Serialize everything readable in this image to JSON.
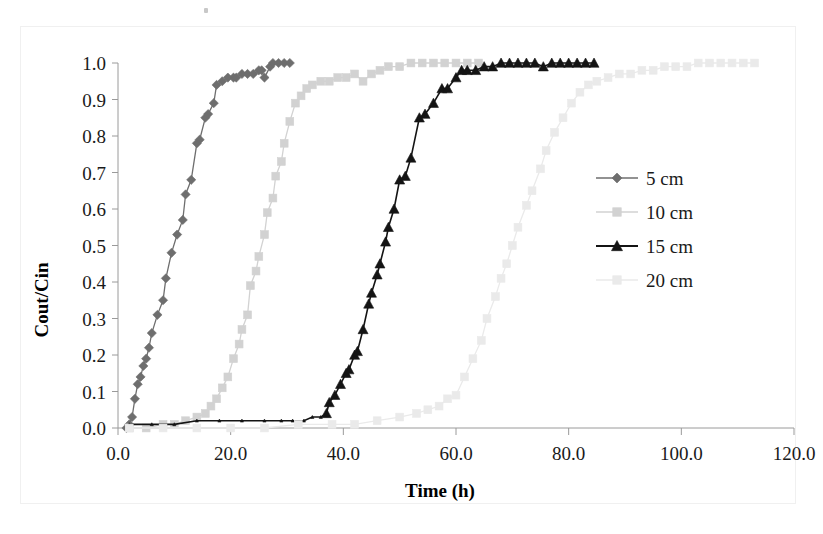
{
  "chart_data": {
    "type": "line",
    "title": "",
    "xlabel": "Time (h)",
    "ylabel": "Cout/Cin",
    "xlim": [
      0,
      120
    ],
    "ylim": [
      0,
      1.0
    ],
    "grid": false,
    "legend_position": "right",
    "x_ticks": [
      "0.0",
      "20.0",
      "40.0",
      "60.0",
      "80.0",
      "100.0",
      "120.0"
    ],
    "x_tick_values": [
      0,
      20,
      40,
      60,
      80,
      100,
      120
    ],
    "y_ticks": [
      "0.0",
      "0.1",
      "0.2",
      "0.3",
      "0.4",
      "0.5",
      "0.6",
      "0.7",
      "0.8",
      "0.9",
      "1.0"
    ],
    "y_tick_values": [
      0,
      0.1,
      0.2,
      0.3,
      0.4,
      0.5,
      0.6,
      0.7,
      0.8,
      0.9,
      1.0
    ],
    "series": [
      {
        "name": "5 cm",
        "color": "#6e6e6e",
        "marker": "diamond",
        "points": [
          [
            1.5,
            0.0
          ],
          [
            2.0,
            0.01
          ],
          [
            2.5,
            0.03
          ],
          [
            3.0,
            0.08
          ],
          [
            3.5,
            0.12
          ],
          [
            4.0,
            0.14
          ],
          [
            4.5,
            0.17
          ],
          [
            5.0,
            0.19
          ],
          [
            5.5,
            0.22
          ],
          [
            6.0,
            0.26
          ],
          [
            7.0,
            0.31
          ],
          [
            8.0,
            0.35
          ],
          [
            8.5,
            0.41
          ],
          [
            9.5,
            0.48
          ],
          [
            10.5,
            0.53
          ],
          [
            11.5,
            0.57
          ],
          [
            12.0,
            0.64
          ],
          [
            13.0,
            0.68
          ],
          [
            14.0,
            0.78
          ],
          [
            14.5,
            0.79
          ],
          [
            15.5,
            0.85
          ],
          [
            16.0,
            0.86
          ],
          [
            17.0,
            0.89
          ],
          [
            17.5,
            0.94
          ],
          [
            18.5,
            0.95
          ],
          [
            19.5,
            0.96
          ],
          [
            20.5,
            0.96
          ],
          [
            21.0,
            0.96
          ],
          [
            22.0,
            0.97
          ],
          [
            23.0,
            0.97
          ],
          [
            24.0,
            0.97
          ],
          [
            25.0,
            0.98
          ],
          [
            25.5,
            0.98
          ],
          [
            26.0,
            0.96
          ],
          [
            27.0,
            0.99
          ],
          [
            27.5,
            1.0
          ],
          [
            28.5,
            1.0
          ],
          [
            29.5,
            1.0
          ],
          [
            30.5,
            1.0
          ]
        ]
      },
      {
        "name": "10 cm",
        "color": "#d2d2d2",
        "marker": "square",
        "points": [
          [
            2.0,
            0.0
          ],
          [
            5.0,
            0.0
          ],
          [
            8.0,
            0.01
          ],
          [
            10.0,
            0.01
          ],
          [
            12.0,
            0.02
          ],
          [
            14.0,
            0.03
          ],
          [
            15.5,
            0.04
          ],
          [
            16.5,
            0.06
          ],
          [
            17.5,
            0.08
          ],
          [
            18.5,
            0.11
          ],
          [
            19.5,
            0.14
          ],
          [
            20.5,
            0.19
          ],
          [
            21.5,
            0.23
          ],
          [
            22.0,
            0.27
          ],
          [
            23.0,
            0.31
          ],
          [
            23.5,
            0.39
          ],
          [
            24.5,
            0.43
          ],
          [
            25.0,
            0.47
          ],
          [
            26.0,
            0.53
          ],
          [
            26.5,
            0.59
          ],
          [
            27.5,
            0.63
          ],
          [
            28.0,
            0.69
          ],
          [
            29.0,
            0.73
          ],
          [
            29.5,
            0.78
          ],
          [
            30.5,
            0.84
          ],
          [
            31.5,
            0.89
          ],
          [
            32.5,
            0.91
          ],
          [
            33.5,
            0.93
          ],
          [
            34.5,
            0.94
          ],
          [
            36.0,
            0.95
          ],
          [
            37.5,
            0.95
          ],
          [
            39.0,
            0.96
          ],
          [
            40.5,
            0.96
          ],
          [
            42.0,
            0.97
          ],
          [
            43.5,
            0.95
          ],
          [
            45.0,
            0.97
          ],
          [
            46.5,
            0.98
          ],
          [
            48.0,
            0.99
          ],
          [
            50.0,
            0.99
          ],
          [
            52.0,
            1.0
          ],
          [
            54.0,
            1.0
          ],
          [
            56.0,
            1.0
          ],
          [
            58.0,
            1.0
          ],
          [
            60.0,
            1.0
          ],
          [
            62.0,
            1.0
          ],
          [
            64.0,
            1.0
          ]
        ]
      },
      {
        "name": "15 cm",
        "color": "#141414",
        "marker": "triangle",
        "points": [
          [
            2.0,
            0.01
          ],
          [
            6.0,
            0.01
          ],
          [
            10.0,
            0.01
          ],
          [
            14.0,
            0.02
          ],
          [
            18.0,
            0.02
          ],
          [
            22.0,
            0.02
          ],
          [
            26.0,
            0.02
          ],
          [
            29.0,
            0.02
          ],
          [
            31.0,
            0.02
          ],
          [
            33.0,
            0.02
          ],
          [
            34.5,
            0.03
          ],
          [
            36.0,
            0.03
          ],
          [
            37.0,
            0.04
          ],
          [
            37.5,
            0.07
          ],
          [
            38.5,
            0.09
          ],
          [
            39.5,
            0.12
          ],
          [
            40.5,
            0.15
          ],
          [
            41.0,
            0.16
          ],
          [
            42.0,
            0.2
          ],
          [
            42.5,
            0.21
          ],
          [
            43.5,
            0.27
          ],
          [
            44.5,
            0.34
          ],
          [
            45.0,
            0.37
          ],
          [
            46.0,
            0.42
          ],
          [
            46.5,
            0.45
          ],
          [
            47.5,
            0.51
          ],
          [
            48.0,
            0.55
          ],
          [
            49.0,
            0.6
          ],
          [
            50.0,
            0.68
          ],
          [
            51.0,
            0.69
          ],
          [
            52.0,
            0.74
          ],
          [
            53.5,
            0.85
          ],
          [
            54.5,
            0.86
          ],
          [
            56.0,
            0.89
          ],
          [
            57.5,
            0.93
          ],
          [
            58.5,
            0.93
          ],
          [
            60.0,
            0.96
          ],
          [
            61.0,
            0.98
          ],
          [
            62.0,
            0.98
          ],
          [
            63.5,
            0.98
          ],
          [
            65.0,
            0.99
          ],
          [
            66.5,
            0.99
          ],
          [
            68.0,
            1.0
          ],
          [
            69.5,
            1.0
          ],
          [
            71.0,
            1.0
          ],
          [
            72.5,
            1.0
          ],
          [
            74.0,
            1.0
          ],
          [
            75.5,
            0.99
          ],
          [
            77.0,
            1.0
          ],
          [
            78.5,
            1.0
          ],
          [
            80.0,
            1.0
          ],
          [
            81.5,
            1.0
          ],
          [
            83.0,
            1.0
          ],
          [
            84.5,
            1.0
          ]
        ]
      },
      {
        "name": "20 cm",
        "color": "#eaeaea",
        "marker": "square",
        "points": [
          [
            2.0,
            0.0
          ],
          [
            8.0,
            0.0
          ],
          [
            14.0,
            0.0
          ],
          [
            20.0,
            0.0
          ],
          [
            26.0,
            0.0
          ],
          [
            32.0,
            0.01
          ],
          [
            38.0,
            0.01
          ],
          [
            42.0,
            0.01
          ],
          [
            46.0,
            0.02
          ],
          [
            50.0,
            0.03
          ],
          [
            53.0,
            0.04
          ],
          [
            55.0,
            0.05
          ],
          [
            57.0,
            0.06
          ],
          [
            58.5,
            0.08
          ],
          [
            60.0,
            0.09
          ],
          [
            61.5,
            0.14
          ],
          [
            63.0,
            0.19
          ],
          [
            64.5,
            0.24
          ],
          [
            65.5,
            0.3
          ],
          [
            67.0,
            0.36
          ],
          [
            68.0,
            0.41
          ],
          [
            69.0,
            0.45
          ],
          [
            70.0,
            0.5
          ],
          [
            71.0,
            0.55
          ],
          [
            72.5,
            0.61
          ],
          [
            73.5,
            0.65
          ],
          [
            75.0,
            0.71
          ],
          [
            76.0,
            0.76
          ],
          [
            77.5,
            0.81
          ],
          [
            79.0,
            0.85
          ],
          [
            80.5,
            0.89
          ],
          [
            82.0,
            0.92
          ],
          [
            83.5,
            0.94
          ],
          [
            85.0,
            0.95
          ],
          [
            87.0,
            0.96
          ],
          [
            89.0,
            0.97
          ],
          [
            91.0,
            0.97
          ],
          [
            93.0,
            0.98
          ],
          [
            95.0,
            0.98
          ],
          [
            97.0,
            0.99
          ],
          [
            99.0,
            0.99
          ],
          [
            101.0,
            0.99
          ],
          [
            103.0,
            1.0
          ],
          [
            105.0,
            1.0
          ],
          [
            107.0,
            1.0
          ],
          [
            109.0,
            1.0
          ],
          [
            111.0,
            1.0
          ],
          [
            113.0,
            1.0
          ]
        ]
      }
    ]
  },
  "legend": {
    "entries": [
      {
        "label": "5 cm"
      },
      {
        "label": "10 cm"
      },
      {
        "label": "15 cm"
      },
      {
        "label": "20 cm"
      }
    ]
  }
}
